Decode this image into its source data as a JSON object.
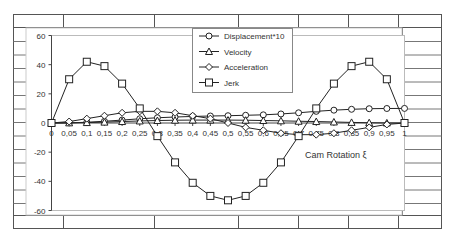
{
  "chart_data": {
    "type": "line",
    "title": "",
    "xlabel": "Cam Rotation ξ",
    "ylabel": "",
    "ylim": [
      -60,
      60
    ],
    "xlim": [
      0,
      1
    ],
    "grid": false,
    "legend_position": "top-center",
    "y_ticks": [
      "60",
      "40",
      "20",
      "0",
      "-20",
      "-40",
      "-60"
    ],
    "x": [
      0,
      0.05,
      0.1,
      0.15,
      0.2,
      0.25,
      0.3,
      0.35,
      0.4,
      0.45,
      0.5,
      0.55,
      0.6,
      0.65,
      0.7,
      0.75,
      0.8,
      0.85,
      0.9,
      0.95,
      1
    ],
    "x_tick_labels": [
      "0",
      "0,05",
      "0,1",
      "0,15",
      "0,2",
      "0,25",
      "0,3",
      "0,35",
      "0,4",
      "0,45",
      "0,5",
      "0,55",
      "0,6",
      "0,65",
      "0,7",
      "0,75",
      "0,8",
      "0,85",
      "0,9",
      "0,95",
      "1"
    ],
    "series": [
      {
        "name": "Displacement*10",
        "marker": "circle",
        "values": [
          0,
          0.1,
          0.5,
          1.2,
          2.0,
          2.9,
          3.6,
          4.1,
          4.5,
          4.8,
          5.0,
          5.3,
          5.6,
          6.2,
          7.0,
          8.0,
          8.8,
          9.4,
          9.8,
          9.95,
          10
        ]
      },
      {
        "name": "Velocity",
        "marker": "triangle",
        "values": [
          0,
          0.1,
          0.3,
          0.6,
          1.0,
          1.4,
          1.7,
          1.9,
          2.0,
          2.0,
          2.0,
          1.9,
          1.7,
          1.5,
          1.2,
          1.0,
          0.7,
          0.4,
          0.2,
          0.05,
          0
        ]
      },
      {
        "name": "Acceleration",
        "marker": "diamond",
        "values": [
          0,
          1,
          3,
          5,
          7,
          8,
          8,
          7,
          5,
          3,
          0,
          -3,
          -5,
          -7,
          -8,
          -8,
          -7,
          -5,
          -3,
          -1,
          0
        ]
      },
      {
        "name": "Jerk",
        "marker": "square",
        "values": [
          0,
          30,
          42,
          39,
          27,
          10,
          -9,
          -27,
          -41,
          -50,
          -53,
          -50,
          -41,
          -27,
          -9,
          10,
          27,
          39,
          42,
          30,
          0
        ]
      }
    ]
  }
}
